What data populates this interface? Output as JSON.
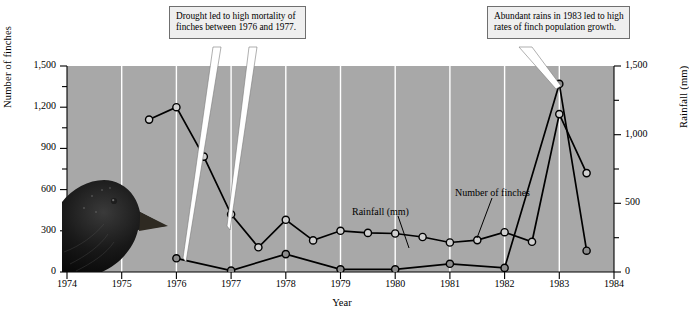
{
  "chart_data": {
    "type": "line",
    "title": "",
    "xlabel": "Year",
    "ylabel": "Number of finches",
    "ylabel_right": "Rainfall (mm)",
    "xlim": [
      1974,
      1984
    ],
    "ylim": [
      0,
      1500
    ],
    "ylim_right": [
      0,
      1500
    ],
    "grid": "vertical-white-gridlines-at-each-year",
    "legend": "inline-labels-with-leader-lines",
    "background": "#a8a8a8",
    "x_ticks": [
      "1974",
      "1975",
      "1976",
      "1977",
      "1978",
      "1979",
      "1980",
      "1981",
      "1982",
      "1983",
      "1984"
    ],
    "y_ticks_left": [
      "0",
      "300",
      "600",
      "900",
      "1,200",
      "1,500"
    ],
    "y_ticks_right": [
      "0",
      "500",
      "1,000",
      "1,500"
    ],
    "series": [
      {
        "name": "Number of finches",
        "marker": "open-circle",
        "axis": "left",
        "x": [
          1975.5,
          1976.0,
          1976.5,
          1977.0,
          1977.5,
          1978.0,
          1978.5,
          1979.0,
          1979.5,
          1980.0,
          1980.5,
          1981.0,
          1981.5,
          1982.0,
          1982.5,
          1983.0,
          1983.5
        ],
        "values": [
          1110,
          1200,
          840,
          420,
          180,
          380,
          230,
          300,
          285,
          280,
          255,
          215,
          232,
          290,
          220,
          1150,
          720
        ]
      },
      {
        "name": "Rainfall (mm)",
        "marker": "filled-circle",
        "axis": "right",
        "x": [
          1976.0,
          1977.0,
          1978.0,
          1979.0,
          1980.0,
          1981.0,
          1982.0,
          1983.0,
          1983.5
        ],
        "values": [
          100,
          10,
          130,
          20,
          20,
          60,
          30,
          1370,
          155
        ]
      }
    ],
    "annotations": [
      {
        "id": "drought",
        "text": "Drought led to high mortality of finches between 1976 and 1977.",
        "points_to": [
          "1976-1977 finch decline",
          "1977 rainfall minimum"
        ]
      },
      {
        "id": "rains",
        "text": "Abundant rains in 1983 led to high rates of finch population growth.",
        "points_to": [
          "1983 rainfall peak"
        ]
      }
    ],
    "inline_labels": [
      {
        "id": "rainfall",
        "text": "Rainfall (mm)"
      },
      {
        "id": "finches",
        "text": "Number of finches"
      }
    ],
    "illustration": "ground-finch-head-photograph"
  },
  "axes": {
    "left_title": "Number of finches",
    "right_title": "Rainfall (mm)",
    "bottom_title": "Year"
  },
  "callouts": {
    "drought": "Drought led to high mortality of finches between 1976 and 1977.",
    "rains": "Abundant rains in 1983 led to high rates of finch population growth."
  },
  "inline": {
    "rainfall": "Rainfall (mm)",
    "finches": "Number of finches"
  },
  "colors": {
    "plot_background": "#a8a8a8",
    "gridline": "#ffffff",
    "series_line": "#000000",
    "finch_marker_fill": "#d0d0d0",
    "rain_marker_fill": "#8d8d8d",
    "callout_background": "#efefef",
    "callout_border": "#6f6f6f",
    "page_background": "#ffffff"
  }
}
